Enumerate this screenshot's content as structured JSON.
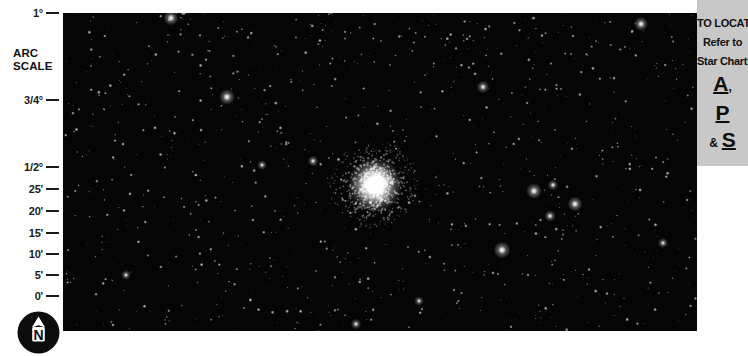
{
  "arc_scale": {
    "caption_line1": "ARC",
    "caption_line2": "SCALE",
    "ticks": [
      {
        "label": "1°",
        "y": 6
      },
      {
        "label": "3/4°",
        "y": 93
      },
      {
        "label": "1/2°",
        "y": 160
      },
      {
        "label": "25'",
        "y": 182
      },
      {
        "label": "20'",
        "y": 204
      },
      {
        "label": "15'",
        "y": 226
      },
      {
        "label": "10'",
        "y": 247
      },
      {
        "label": "5'",
        "y": 268
      },
      {
        "label": "0'",
        "y": 289
      }
    ]
  },
  "compass": {
    "direction_label": "N",
    "icon": "north-arrow-icon",
    "circle_color": "#0c0c0c",
    "arrow_color": "#ffffff"
  },
  "photo": {
    "caption": "",
    "background_color": "#050505",
    "star_color": "#ffffff"
  },
  "locate_panel": {
    "background_color": "#c8c8c8",
    "line1": "TO LOCATE",
    "line2": "Refer to",
    "line3": "Star Charts",
    "chart_a": "A",
    "chart_a_punct": ",",
    "chart_p": "P",
    "ampersand": "&",
    "chart_s": "S"
  },
  "chart_data": {
    "type": "scatter",
    "title": "",
    "xlabel": "",
    "ylabel": "Arc Scale",
    "grid": false,
    "legend": null,
    "axis_note": "Vertical arc-minute / degree scale at left edge of photographic plate",
    "ytick_labels": [
      "0'",
      "5'",
      "10'",
      "15'",
      "20'",
      "25'",
      "1/2°",
      "3/4°",
      "1°"
    ],
    "ytick_values": [
      0,
      5,
      10,
      15,
      20,
      25,
      30,
      45,
      60
    ],
    "ylim": [
      0,
      60
    ],
    "units": "arcminutes",
    "objects": [
      {
        "name": "globular-cluster-core",
        "x": 312,
        "y": 172,
        "core_radius": 11,
        "halo_radius": 46,
        "brightness": 1.0
      },
      {
        "name": "bright-star-1",
        "x": 108,
        "y": 5,
        "radius": 3.4,
        "brightness": 0.96
      },
      {
        "name": "bright-star-2",
        "x": 164,
        "y": 84,
        "radius": 3.6,
        "brightness": 0.97
      },
      {
        "name": "bright-star-3",
        "x": 420,
        "y": 74,
        "radius": 2.8,
        "brightness": 0.9
      },
      {
        "name": "bright-star-4",
        "x": 439,
        "y": 237,
        "radius": 3.8,
        "brightness": 0.98
      },
      {
        "name": "bright-star-5",
        "x": 471,
        "y": 178,
        "radius": 3.6,
        "brightness": 0.96
      },
      {
        "name": "bright-star-6",
        "x": 512,
        "y": 191,
        "radius": 3.4,
        "brightness": 0.94
      },
      {
        "name": "bright-star-7",
        "x": 487,
        "y": 203,
        "radius": 2.6,
        "brightness": 0.88
      },
      {
        "name": "bright-star-8",
        "x": 490,
        "y": 172,
        "radius": 2.4,
        "brightness": 0.86
      },
      {
        "name": "bright-star-9",
        "x": 578,
        "y": 11,
        "radius": 3.2,
        "brightness": 0.93
      },
      {
        "name": "bright-star-10",
        "x": 250,
        "y": 148,
        "radius": 2.4,
        "brightness": 0.85
      },
      {
        "name": "bright-star-11",
        "x": 199,
        "y": 152,
        "radius": 2.2,
        "brightness": 0.82
      },
      {
        "name": "bright-star-12",
        "x": 293,
        "y": 311,
        "radius": 2.4,
        "brightness": 0.84
      },
      {
        "name": "bright-star-13",
        "x": 356,
        "y": 288,
        "radius": 2.2,
        "brightness": 0.8
      },
      {
        "name": "bright-star-14",
        "x": 600,
        "y": 230,
        "radius": 2.3,
        "brightness": 0.82
      },
      {
        "name": "bright-star-15",
        "x": 63,
        "y": 262,
        "radius": 2.2,
        "brightness": 0.8
      }
    ],
    "field_star_count": 1500
  }
}
